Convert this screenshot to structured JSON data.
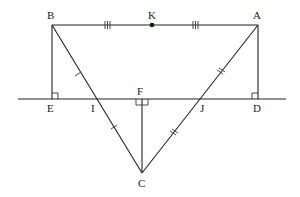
{
  "diagram": {
    "type": "geometry",
    "points": {
      "B": {
        "label": "B",
        "x": 52,
        "y": 25
      },
      "K": {
        "label": "K",
        "x": 152,
        "y": 25
      },
      "A": {
        "label": "A",
        "x": 258,
        "y": 25
      },
      "E": {
        "label": "E",
        "x": 52,
        "y": 99
      },
      "I": {
        "label": "I",
        "x": 96,
        "y": 99
      },
      "F": {
        "label": "F",
        "x": 142,
        "y": 99
      },
      "J": {
        "label": "J",
        "x": 199,
        "y": 99
      },
      "D": {
        "label": "D",
        "x": 258,
        "y": 99
      },
      "C": {
        "label": "C",
        "x": 142,
        "y": 173
      }
    },
    "segments": [
      "BA",
      "BE",
      "AD",
      "BC",
      "AC",
      "FC",
      "line ED"
    ],
    "markings": {
      "BK_AK": "triple tick (equal)",
      "BI_IC": "single tick (equal)",
      "AJ_JC": "double tick (equal)",
      "right_angles": [
        "E",
        "F",
        "D"
      ]
    },
    "colors": {
      "stroke": "#222222",
      "background": "#ffffff"
    }
  }
}
